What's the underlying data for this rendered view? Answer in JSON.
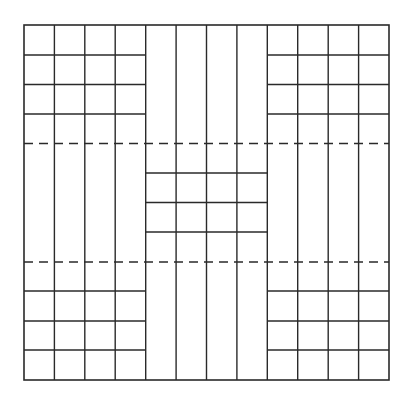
{
  "diagram": {
    "colors": {
      "line": "#2a2a2a",
      "background": "#ffffff"
    },
    "outer_box": {
      "x": 24,
      "y": 25,
      "width": 365,
      "height": 355
    },
    "columns_x": [
      24,
      54.4,
      84.8,
      115.2,
      145.7,
      176.1,
      206.5,
      236.9,
      267.3,
      297.7,
      328.2,
      358.6,
      389
    ],
    "corner_rows_top_y": [
      55,
      84.5,
      114
    ],
    "corner_rows_bottom_y": [
      291,
      321,
      350
    ],
    "center_rows_y": [
      173,
      202.5,
      232
    ],
    "dashed_lines_y": [
      143.5,
      262
    ],
    "blocks": [
      {
        "name": "top-left-block",
        "cols": [
          0,
          4
        ],
        "row_lines": "corner_rows_top_y"
      },
      {
        "name": "top-right-block",
        "cols": [
          8,
          12
        ],
        "row_lines": "corner_rows_top_y"
      },
      {
        "name": "center-block",
        "cols": [
          4,
          8
        ],
        "row_lines": "center_rows_y"
      },
      {
        "name": "bottom-left-block",
        "cols": [
          0,
          4
        ],
        "row_lines": "corner_rows_bottom_y"
      },
      {
        "name": "bottom-right-block",
        "cols": [
          8,
          12
        ],
        "row_lines": "corner_rows_bottom_y"
      }
    ]
  }
}
